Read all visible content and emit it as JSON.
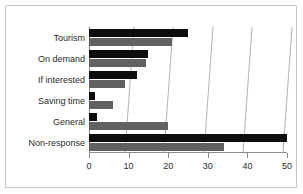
{
  "chart_data": {
    "type": "bar",
    "orientation": "horizontal",
    "title": "",
    "xlabel": "",
    "ylabel": "",
    "xlim": [
      0,
      50
    ],
    "xticks": [
      0,
      10,
      20,
      30,
      40,
      50
    ],
    "grid": true,
    "legend": "none",
    "categories": [
      "Tourism",
      "On demand",
      "If interested",
      "Saving time",
      "General",
      "Non-response"
    ],
    "series": [
      {
        "name": "series-1",
        "color": "#0d0d0d",
        "values": [
          25,
          15,
          12,
          1.5,
          2,
          50
        ]
      },
      {
        "name": "series-2",
        "color": "#616161",
        "values": [
          21,
          14.5,
          9,
          6,
          20,
          34
        ]
      }
    ]
  },
  "style": {
    "frame_border": "#c8c8c8",
    "gridline": "#b4b4b4",
    "axis": "#8c8c8c",
    "background": "#ffffff",
    "text": "#2b2b2b"
  }
}
